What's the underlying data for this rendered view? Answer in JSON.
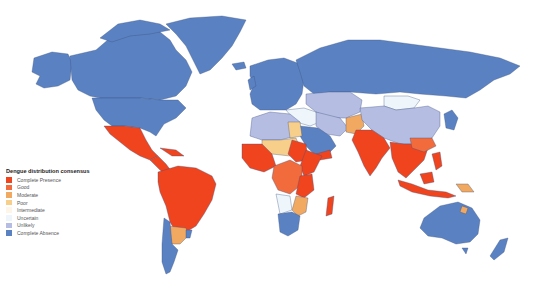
{
  "map": {
    "title": "Dengue distribution consensus",
    "projection": "world choropleth",
    "legend": {
      "title": "Dengue distribution consensus",
      "items": [
        {
          "key": "complete_presence",
          "label": "Complete Presence",
          "color": "#f0441f"
        },
        {
          "key": "good",
          "label": "Good",
          "color": "#f26b3c"
        },
        {
          "key": "moderate",
          "label": "Moderate",
          "color": "#f1a860"
        },
        {
          "key": "poor",
          "label": "Poor",
          "color": "#f8cf8a"
        },
        {
          "key": "intermediate",
          "label": "Intermediate",
          "color": "#fdf6e8"
        },
        {
          "key": "uncertain",
          "label": "Uncertain",
          "color": "#eef6fb"
        },
        {
          "key": "unlikely",
          "label": "Unlikely",
          "color": "#b5bde3"
        },
        {
          "key": "complete_absence",
          "label": "Complete Absence",
          "color": "#5a82c2"
        }
      ]
    },
    "regions": [
      {
        "name": "North America",
        "category": "complete_absence"
      },
      {
        "name": "Greenland",
        "category": "complete_absence"
      },
      {
        "name": "Mexico & Central America",
        "category": "complete_presence"
      },
      {
        "name": "Caribbean",
        "category": "complete_presence"
      },
      {
        "name": "Brazil & northern South America",
        "category": "complete_presence"
      },
      {
        "name": "Argentina (north)",
        "category": "moderate"
      },
      {
        "name": "Chile & southern Argentina",
        "category": "complete_absence"
      },
      {
        "name": "Europe",
        "category": "complete_absence"
      },
      {
        "name": "Russia",
        "category": "complete_absence"
      },
      {
        "name": "Mongolia",
        "category": "uncertain"
      },
      {
        "name": "China",
        "category": "unlikely"
      },
      {
        "name": "Central Asia",
        "category": "unlikely"
      },
      {
        "name": "North Africa",
        "category": "unlikely"
      },
      {
        "name": "Egypt",
        "category": "poor"
      },
      {
        "name": "Arabian Peninsula",
        "category": "complete_absence"
      },
      {
        "name": "Yemen",
        "category": "complete_presence"
      },
      {
        "name": "Pakistan/Afghanistan",
        "category": "moderate"
      },
      {
        "name": "India",
        "category": "complete_presence"
      },
      {
        "name": "Southeast Asia",
        "category": "complete_presence"
      },
      {
        "name": "Indonesia & Philippines",
        "category": "complete_presence"
      },
      {
        "name": "Papua New Guinea",
        "category": "moderate"
      },
      {
        "name": "West Africa",
        "category": "complete_presence"
      },
      {
        "name": "Sahel",
        "category": "poor"
      },
      {
        "name": "Central Africa",
        "category": "good"
      },
      {
        "name": "East Africa",
        "category": "complete_presence"
      },
      {
        "name": "Southern Africa",
        "category": "complete_absence"
      },
      {
        "name": "Madagascar",
        "category": "complete_presence"
      },
      {
        "name": "Australia",
        "category": "complete_absence"
      },
      {
        "name": "Queensland (north)",
        "category": "moderate"
      },
      {
        "name": "New Zealand",
        "category": "complete_absence"
      },
      {
        "name": "Japan",
        "category": "complete_absence"
      }
    ]
  }
}
